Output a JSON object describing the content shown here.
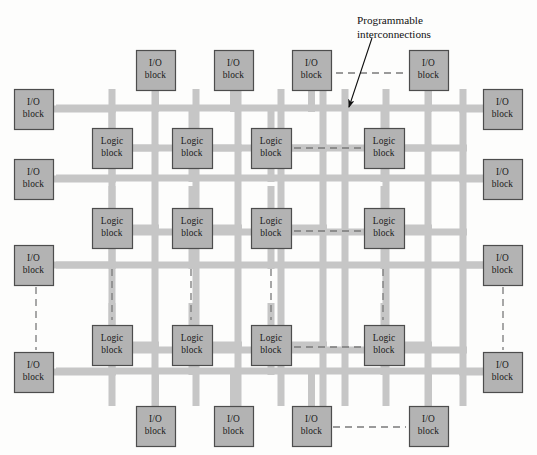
{
  "figure": {
    "width": 537,
    "height": 455,
    "background_color": "#fdfdfc"
  },
  "colors": {
    "block_fill": "#b3b3b3",
    "block_stroke": "#4d4d4d",
    "bus_color": "#c6c6c6",
    "dashed_color": "#7a7a7a",
    "text_color": "#111111"
  },
  "labels": {
    "io_block_line1": "I/O",
    "io_block_line2": "block",
    "logic_block_line1": "Logic",
    "logic_block_line2": "block"
  },
  "annotation": {
    "line1": "Programmable",
    "line2": "interconnections",
    "x": 357,
    "y": 14,
    "arrow_from_x": 372,
    "arrow_from_y": 38,
    "arrow_to_x": 349,
    "arrow_to_y": 107
  },
  "geometry": {
    "io_block_w": 39,
    "io_block_h": 40,
    "logic_block_w": 40,
    "logic_block_h": 40,
    "bus_thickness": 7,
    "h_bus_x_start": 56,
    "h_bus_x_end": 483,
    "v_bus_y_start": 89,
    "v_bus_y_end": 406,
    "h_bus_rows": [
      108,
      178,
      265,
      371
    ],
    "h_bus_inner_rows": [
      148,
      232,
      350
    ],
    "v_bus_cols": [
      112,
      155,
      196,
      238,
      281,
      323,
      345,
      386,
      428,
      463
    ],
    "logic_cols": [
      92,
      172,
      251,
      364
    ],
    "logic_rows": [
      128,
      208,
      325
    ],
    "io_top_x": [
      136,
      214,
      292,
      409
    ],
    "io_top_y": 50,
    "io_bottom_x": [
      136,
      214,
      292,
      409
    ],
    "io_bottom_y": 406,
    "io_left_x": 14,
    "io_left_y": [
      89,
      159,
      245,
      352
    ],
    "io_right_x": 483,
    "io_right_y": [
      89,
      159,
      245,
      352
    ]
  },
  "blocks": {
    "io_top": [
      {
        "name": "io-block-top-1",
        "x": 136,
        "y": 50
      },
      {
        "name": "io-block-top-2",
        "x": 214,
        "y": 50
      },
      {
        "name": "io-block-top-3",
        "x": 292,
        "y": 50
      },
      {
        "name": "io-block-top-4",
        "x": 409,
        "y": 50
      }
    ],
    "io_bottom": [
      {
        "name": "io-block-bottom-1",
        "x": 136,
        "y": 406
      },
      {
        "name": "io-block-bottom-2",
        "x": 214,
        "y": 406
      },
      {
        "name": "io-block-bottom-3",
        "x": 292,
        "y": 406
      },
      {
        "name": "io-block-bottom-4",
        "x": 409,
        "y": 406
      }
    ],
    "io_left": [
      {
        "name": "io-block-left-1",
        "x": 14,
        "y": 89
      },
      {
        "name": "io-block-left-2",
        "x": 14,
        "y": 159
      },
      {
        "name": "io-block-left-3",
        "x": 14,
        "y": 245
      },
      {
        "name": "io-block-left-4",
        "x": 14,
        "y": 352
      }
    ],
    "io_right": [
      {
        "name": "io-block-right-1",
        "x": 483,
        "y": 89
      },
      {
        "name": "io-block-right-2",
        "x": 483,
        "y": 159
      },
      {
        "name": "io-block-right-3",
        "x": 483,
        "y": 245
      },
      {
        "name": "io-block-right-4",
        "x": 483,
        "y": 352
      }
    ],
    "logic": [
      {
        "name": "logic-block-r1c1",
        "x": 92,
        "y": 128
      },
      {
        "name": "logic-block-r1c2",
        "x": 172,
        "y": 128
      },
      {
        "name": "logic-block-r1c3",
        "x": 251,
        "y": 128
      },
      {
        "name": "logic-block-r1c4",
        "x": 364,
        "y": 128
      },
      {
        "name": "logic-block-r2c1",
        "x": 92,
        "y": 208
      },
      {
        "name": "logic-block-r2c2",
        "x": 172,
        "y": 208
      },
      {
        "name": "logic-block-r2c3",
        "x": 251,
        "y": 208
      },
      {
        "name": "logic-block-r2c4",
        "x": 364,
        "y": 208
      },
      {
        "name": "logic-block-r3c1",
        "x": 92,
        "y": 325
      },
      {
        "name": "logic-block-r3c2",
        "x": 172,
        "y": 325
      },
      {
        "name": "logic-block-r3c3",
        "x": 251,
        "y": 325
      },
      {
        "name": "logic-block-r3c4",
        "x": 364,
        "y": 325
      }
    ]
  },
  "ellipsis_connections": {
    "horizontal": [
      {
        "name": "dashed-link-top-io",
        "x1": 336,
        "y1": 73,
        "x2": 406,
        "y2": 73
      },
      {
        "name": "dashed-link-logic-row1",
        "x1": 294,
        "y1": 148,
        "x2": 361,
        "y2": 148
      },
      {
        "name": "dashed-link-logic-row2",
        "x1": 294,
        "y1": 231,
        "x2": 361,
        "y2": 231
      },
      {
        "name": "dashed-link-logic-row3",
        "x1": 294,
        "y1": 347,
        "x2": 361,
        "y2": 347
      },
      {
        "name": "dashed-link-bottom-io",
        "x1": 333,
        "y1": 427,
        "x2": 406,
        "y2": 427
      }
    ],
    "vertical": [
      {
        "name": "dashed-link-left-io",
        "x1": 36,
        "y1": 287,
        "x2": 36,
        "y2": 350
      },
      {
        "name": "dashed-link-col1",
        "x1": 112,
        "y1": 269,
        "x2": 112,
        "y2": 320
      },
      {
        "name": "dashed-link-col2",
        "x1": 191,
        "y1": 269,
        "x2": 191,
        "y2": 320
      },
      {
        "name": "dashed-link-col3",
        "x1": 271,
        "y1": 269,
        "x2": 271,
        "y2": 320
      },
      {
        "name": "dashed-link-col4",
        "x1": 383,
        "y1": 269,
        "x2": 383,
        "y2": 320
      },
      {
        "name": "dashed-link-right-io",
        "x1": 503,
        "y1": 287,
        "x2": 503,
        "y2": 350
      }
    ]
  }
}
